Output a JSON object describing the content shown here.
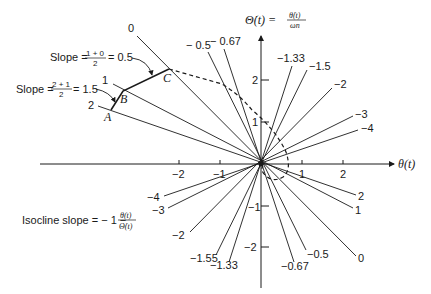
{
  "diagram": {
    "axes": {
      "x_label": "θ(t)",
      "y_label_main": "Θ̇(t) =",
      "y_label_num": "θ̇(t)",
      "y_label_den": "ωn",
      "x_ticks": [
        {
          "value": -2,
          "label": "−2"
        },
        {
          "value": -1,
          "label": "−1"
        },
        {
          "value": 1,
          "label": "1"
        },
        {
          "value": 2,
          "label": "2"
        }
      ],
      "y_ticks": [
        {
          "value": 2,
          "label": "2"
        },
        {
          "value": 1,
          "label": "1"
        },
        {
          "value": -1,
          "label": "−1"
        },
        {
          "value": -2,
          "label": "−2"
        }
      ]
    },
    "isoclines": [
      {
        "slope": "0",
        "upper_label": "0",
        "lower_label": "0"
      },
      {
        "slope": "1",
        "upper_label": "1",
        "lower_label": "1"
      },
      {
        "slope": "2",
        "upper_label": "2",
        "lower_label": "2"
      },
      {
        "slope": "-0.5",
        "upper_label": "− 0.5",
        "lower_label": "−0.5"
      },
      {
        "slope": "-0.67",
        "upper_label": "− 0.67",
        "lower_label": "−0.67"
      },
      {
        "slope": "-1.33",
        "upper_label": "−1.33",
        "lower_label": "−1.33"
      },
      {
        "slope": "-1.5",
        "upper_label": "−1.5",
        "lower_label": "−1.55"
      },
      {
        "slope": "-2",
        "upper_label": "−2",
        "lower_label": "−2"
      },
      {
        "slope": "-3",
        "upper_label": "−3",
        "lower_label": "−3"
      },
      {
        "slope": "-4",
        "upper_label": "−4",
        "lower_label": "−4"
      }
    ],
    "points": [
      {
        "name": "A",
        "label": "A"
      },
      {
        "name": "B",
        "label": "B"
      },
      {
        "name": "C",
        "label": "C"
      }
    ],
    "annotations": {
      "slope1_prefix": "Slope =",
      "slope1_num": "1 + 0",
      "slope1_den": "2",
      "slope1_result": "= 0.5",
      "slope2_prefix": "Slope =",
      "slope2_num": "2 + 1",
      "slope2_den": "2",
      "slope2_result": "= 1.5",
      "isocline_prefix": "Isocline slope = − 1 −",
      "isocline_num": "θ(t)",
      "isocline_den": "Θ̇(t)"
    },
    "colors": {
      "ink": "#1a1a1a",
      "background": "#ffffff"
    }
  }
}
